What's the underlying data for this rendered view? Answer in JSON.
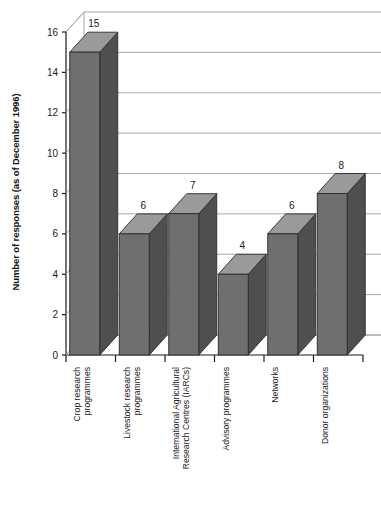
{
  "chart_data": {
    "type": "bar",
    "title": "",
    "subtitle": "",
    "xlabel": "",
    "ylabel": "Number of responses (as of December 1996)",
    "ylim": [
      0,
      16
    ],
    "ytick_labels": [
      "0",
      "2",
      "4",
      "6",
      "8",
      "10",
      "12",
      "14",
      "16"
    ],
    "yticks": [
      0,
      2,
      4,
      6,
      8,
      10,
      12,
      14,
      16
    ],
    "grid": true,
    "legend": "none",
    "style": "3d-bars",
    "categories": [
      "Crop research programmes",
      "Livestock research programmes",
      "International Agricultural Research Centres (IARCs)",
      "Advisory programmes",
      "Networks",
      "Donor organizations"
    ],
    "category_lines": [
      [
        "Crop research",
        "programmes"
      ],
      [
        "Livestock research",
        "programmes"
      ],
      [
        "International Agricultural",
        "Research Centres (IARCs)"
      ],
      [
        "Advisory programmes"
      ],
      [
        "Networks"
      ],
      [
        "Donor organizations"
      ]
    ],
    "values": [
      15,
      6,
      7,
      4,
      6,
      8
    ],
    "value_labels": [
      "15",
      "6",
      "7",
      "4",
      "6",
      "8"
    ],
    "colors": {
      "bar_front": "#6f6f6f",
      "bar_top": "#9a9a9a",
      "bar_side": "#4f4f4f",
      "bar_outline": "#2a2a2a",
      "gridline": "#a8a8a8",
      "axis": "#1a1a1a",
      "background": "#ffffff",
      "text": "#1a1a1a"
    }
  }
}
